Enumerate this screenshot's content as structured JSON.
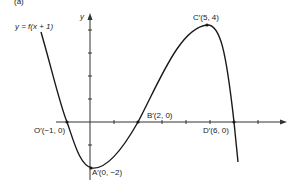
{
  "figure": {
    "panel_label": "(a)",
    "function_label": "y = f(x + 1)",
    "axis_labels": {
      "y": "y"
    },
    "points": [
      {
        "id": "O",
        "label": "O′(−1, 0)",
        "x": -1,
        "y": 0
      },
      {
        "id": "A",
        "label": "A′(0, −2)",
        "x": 0,
        "y": -2
      },
      {
        "id": "B",
        "label": "B′(2, 0)",
        "x": 2,
        "y": 0
      },
      {
        "id": "C",
        "label": "C′(5, 4)",
        "x": 5,
        "y": 4
      },
      {
        "id": "D",
        "label": "D′(6, 0)",
        "x": 6,
        "y": 0
      }
    ],
    "colors": {
      "curve": "#1a1a1a",
      "axes": "#333333",
      "background": "#ffffff"
    }
  }
}
